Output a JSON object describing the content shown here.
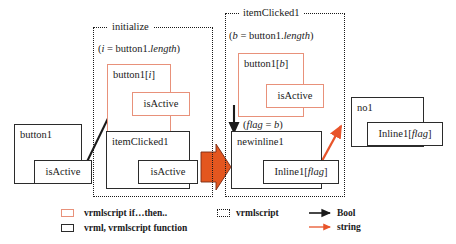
{
  "diagram": {
    "panels": [
      {
        "id": "initialize",
        "title": "initialize"
      },
      {
        "id": "itemClicked1",
        "title": "itemClicked1"
      }
    ],
    "expressions": {
      "init_assign_prefix": "(",
      "init_var": "i",
      "init_eq": " = button1.",
      "init_prop": "length",
      "init_suffix": ")",
      "click_var": "b",
      "flag_open": "(",
      "flag_var": "flag",
      "flag_eq": " = ",
      "flag_val": "b",
      "flag_close": ")"
    },
    "nodes": {
      "button1": "button1",
      "isActive_left": "isActive",
      "button1_i_name": "button1[",
      "button1_i_idx": "i",
      "button1_i_close": "]",
      "isActive_init": "isActive",
      "itemClicked1_box": "itemClicked1",
      "isActive_item": "isActive",
      "button1_b_name": "button1[",
      "button1_b_idx": "b",
      "button1_b_close": "]",
      "isActive_click": "isActive",
      "newinline1": "newinline1",
      "inline1_flag_name": "Inline1[",
      "inline1_flag_idx": "flag",
      "inline1_flag_close": "]",
      "no1": "no1",
      "inline1_flag2_name": "Inline1[",
      "inline1_flag2_idx": "flag",
      "inline1_flag2_close": "]"
    },
    "legend": [
      {
        "swatch": "orange-box",
        "label": "vrmlscript if…then.."
      },
      {
        "swatch": "black-box",
        "label": "vrml, vrmlscript function"
      },
      {
        "swatch": "dotted-box",
        "label": "vrmlscript"
      },
      {
        "swatch": "black-arrow",
        "label": "Bool"
      },
      {
        "swatch": "red-arrow",
        "label": "string"
      }
    ],
    "colors": {
      "orange_stroke": "#e8917a",
      "red_arrow": "#e8542a",
      "big_arrow_fill": "#e3561f",
      "black": "#1a1a1a"
    }
  }
}
